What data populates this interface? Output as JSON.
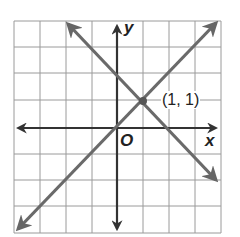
{
  "graph": {
    "x_axis_label": "x",
    "y_axis_label": "y",
    "origin_label": "O",
    "point_label": "(1, 1)",
    "grid": {
      "x_range": [
        -4,
        4
      ],
      "y_range": [
        -4,
        4
      ],
      "cells": 8
    },
    "lines": [
      {
        "name": "line-increasing",
        "equation": "y = x",
        "slope": 1,
        "intercept": 0
      },
      {
        "name": "line-decreasing",
        "equation": "y = -x + 2",
        "slope": -1,
        "intercept": 2
      }
    ],
    "intersection": {
      "x": 1,
      "y": 1
    },
    "colors": {
      "grid": "#8a8a8a",
      "axis": "#3a3a3a",
      "line": "#6e6e6e",
      "background": "#ffffff"
    }
  }
}
